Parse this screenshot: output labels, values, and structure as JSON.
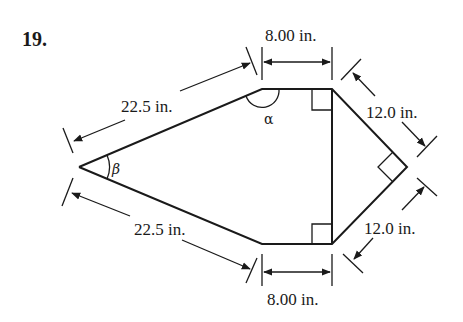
{
  "problem": {
    "number": "19."
  },
  "figure": {
    "shape": "pentagon-like hexagon (kite) with vertical chord",
    "dimensions": {
      "top_left_side": "22.5 in.",
      "bottom_left_side": "22.5 in.",
      "top_width": "8.00 in.",
      "bottom_width": "8.00 in.",
      "upper_right_side": "12.0 in.",
      "lower_right_side": "12.0 in."
    },
    "angles": {
      "alpha": "α",
      "beta": "β"
    },
    "right_angle_markers": 3,
    "colors": {
      "line": "#1a1a1a",
      "background": "#ffffff"
    }
  }
}
